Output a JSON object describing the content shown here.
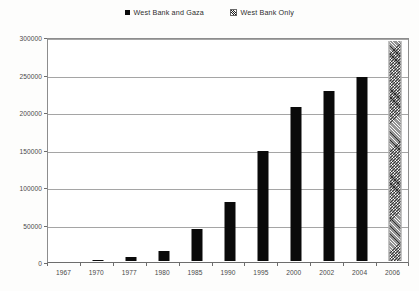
{
  "legend": {
    "position": "top-center",
    "entries": [
      {
        "label": "West Bank and Gaza",
        "swatch": "solid-black-square",
        "color": "#0a0a0a"
      },
      {
        "label": "West Bank Only",
        "swatch": "hatched-square",
        "color": "#2b2b2b"
      }
    ]
  },
  "axes": {
    "y_ticks": [
      "0",
      "50000",
      "100000",
      "150000",
      "200000",
      "250000",
      "300000"
    ],
    "x_ticks": [
      "1967",
      "1970",
      "1977",
      "1980",
      "1985",
      "1990",
      "1995",
      "2000",
      "2002",
      "2004",
      "2006"
    ]
  },
  "chart_data": {
    "type": "bar",
    "title": "",
    "xlabel": "",
    "ylabel": "",
    "ylim": [
      0,
      300000
    ],
    "ytick_step": 50000,
    "grid": true,
    "legend_position": "top-center",
    "categories": [
      "1967",
      "1970",
      "1977",
      "1980",
      "1985",
      "1990",
      "1995",
      "2000",
      "2002",
      "2004",
      "2006"
    ],
    "series": [
      {
        "name": "West Bank and Gaza",
        "style": "solid",
        "color": "#0a0a0a",
        "values": [
          0,
          1500,
          5000,
          13500,
          43000,
          79000,
          147000,
          205000,
          227000,
          245000,
          null
        ]
      },
      {
        "name": "West Bank Only",
        "style": "hatched",
        "color": "#2b2b2b",
        "values": [
          null,
          null,
          null,
          null,
          null,
          null,
          null,
          null,
          null,
          null,
          294000
        ]
      }
    ]
  }
}
